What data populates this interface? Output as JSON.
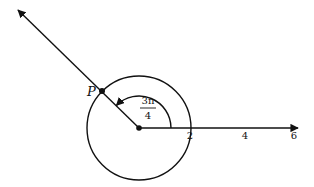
{
  "diagram": {
    "point_label": "P",
    "angle": {
      "numerator": "3π",
      "denominator": "4"
    },
    "axis_ticks": [
      "2",
      "4",
      "6"
    ],
    "circle_radius": 2,
    "colors": {
      "stroke": "#111111",
      "background": "#ffffff"
    }
  }
}
